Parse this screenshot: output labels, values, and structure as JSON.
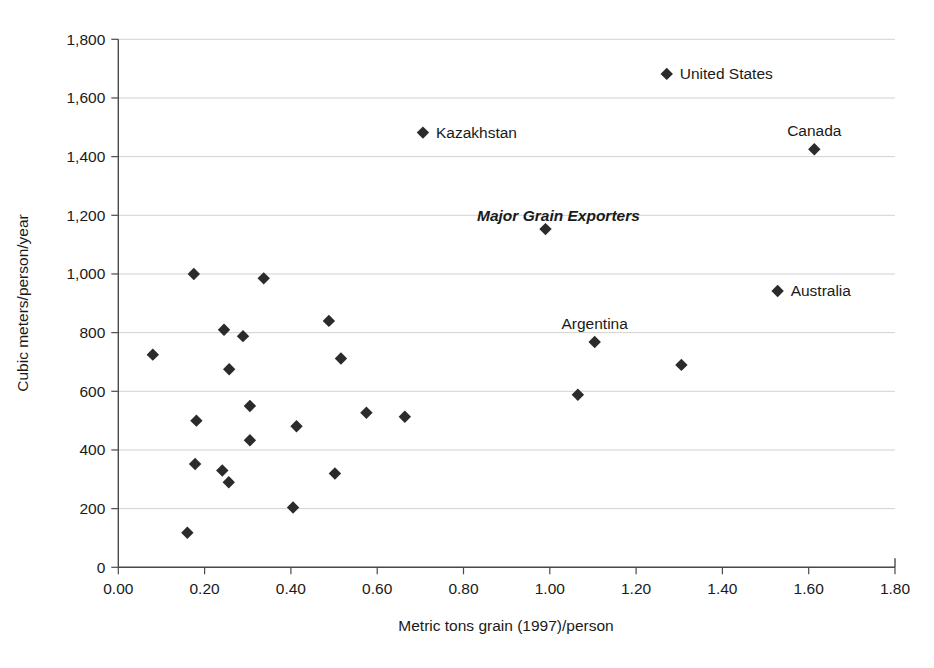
{
  "chart_data": {
    "type": "scatter",
    "title": "",
    "xlabel": "Metric tons grain (1997)/person",
    "ylabel": "Cubic meters/person/year",
    "xlim": [
      0.0,
      1.8
    ],
    "ylim": [
      0,
      1800
    ],
    "grid": true,
    "legend": null,
    "xticks": [
      "0.00",
      "0.20",
      "0.40",
      "0.60",
      "0.80",
      "1.00",
      "1.20",
      "1.40",
      "1.60",
      "1.80"
    ],
    "xtick_values": [
      0.0,
      0.2,
      0.4,
      0.6,
      0.8,
      1.0,
      1.2,
      1.4,
      1.6,
      1.8
    ],
    "yticks": [
      "0",
      "200",
      "400",
      "600",
      "800",
      "1,000",
      "1,200",
      "1,400",
      "1,600",
      "1,800"
    ],
    "ytick_values": [
      0,
      200,
      400,
      600,
      800,
      1000,
      1200,
      1400,
      1600,
      1800
    ],
    "marker_shape": "diamond",
    "marker_color": "#2b2b2b",
    "points": [
      {
        "x": 0.08,
        "y": 725,
        "label": ""
      },
      {
        "x": 0.16,
        "y": 118,
        "label": ""
      },
      {
        "x": 0.175,
        "y": 1000,
        "label": ""
      },
      {
        "x": 0.178,
        "y": 352,
        "label": ""
      },
      {
        "x": 0.181,
        "y": 500,
        "label": ""
      },
      {
        "x": 0.241,
        "y": 330,
        "label": ""
      },
      {
        "x": 0.245,
        "y": 810,
        "label": ""
      },
      {
        "x": 0.256,
        "y": 290,
        "label": ""
      },
      {
        "x": 0.257,
        "y": 675,
        "label": ""
      },
      {
        "x": 0.289,
        "y": 788,
        "label": ""
      },
      {
        "x": 0.305,
        "y": 550,
        "label": ""
      },
      {
        "x": 0.305,
        "y": 433,
        "label": ""
      },
      {
        "x": 0.337,
        "y": 985,
        "label": ""
      },
      {
        "x": 0.405,
        "y": 204,
        "label": ""
      },
      {
        "x": 0.413,
        "y": 481,
        "label": ""
      },
      {
        "x": 0.488,
        "y": 840,
        "label": ""
      },
      {
        "x": 0.502,
        "y": 320,
        "label": ""
      },
      {
        "x": 0.516,
        "y": 712,
        "label": ""
      },
      {
        "x": 0.575,
        "y": 527,
        "label": ""
      },
      {
        "x": 0.664,
        "y": 513,
        "label": ""
      },
      {
        "x": 0.706,
        "y": 1482,
        "label": "Kazakhstan",
        "label_pos": "right"
      },
      {
        "x": 0.99,
        "y": 1153,
        "label": ""
      },
      {
        "x": 1.065,
        "y": 588,
        "label": ""
      },
      {
        "x": 1.104,
        "y": 768,
        "label": "Argentina",
        "label_pos": "above"
      },
      {
        "x": 1.271,
        "y": 1682,
        "label": "United States",
        "label_pos": "right"
      },
      {
        "x": 1.305,
        "y": 690,
        "label": ""
      },
      {
        "x": 1.528,
        "y": 942,
        "label": "Australia",
        "label_pos": "right"
      },
      {
        "x": 1.613,
        "y": 1425,
        "label": "Canada",
        "label_pos": "above"
      }
    ],
    "annotations": [
      {
        "text": "Major Grain Exporters",
        "x": 1.02,
        "y": 1200,
        "style": "bold-italic"
      }
    ]
  }
}
